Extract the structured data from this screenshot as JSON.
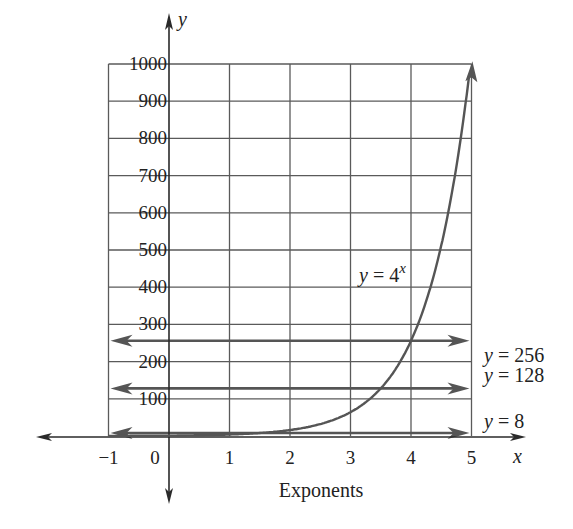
{
  "chart_data": {
    "type": "line",
    "title": "",
    "xlabel": "Exponents",
    "ylabel": "",
    "x_axis_symbol": "x",
    "y_axis_symbol": "y",
    "xlim": [
      -1,
      5
    ],
    "ylim": [
      0,
      1000
    ],
    "grid": true,
    "x_ticks": [
      "-1",
      "0",
      "1",
      "2",
      "3",
      "4",
      "5"
    ],
    "y_ticks": [
      "100",
      "200",
      "300",
      "400",
      "500",
      "600",
      "700",
      "800",
      "900",
      "1000"
    ],
    "series": [
      {
        "name": "y = 4^x",
        "label_base": "y = 4",
        "label_exponent": "x",
        "x": [
          -1,
          0,
          1,
          2,
          3,
          4,
          4.5,
          4.98
        ],
        "y": [
          0.25,
          1,
          4,
          16,
          64,
          256,
          512,
          1000
        ]
      }
    ],
    "horizontal_lines": [
      {
        "label": "y = 256",
        "value": 256
      },
      {
        "label": "y = 128",
        "value": 128
      },
      {
        "label": "y = 8",
        "value": 8
      }
    ]
  }
}
